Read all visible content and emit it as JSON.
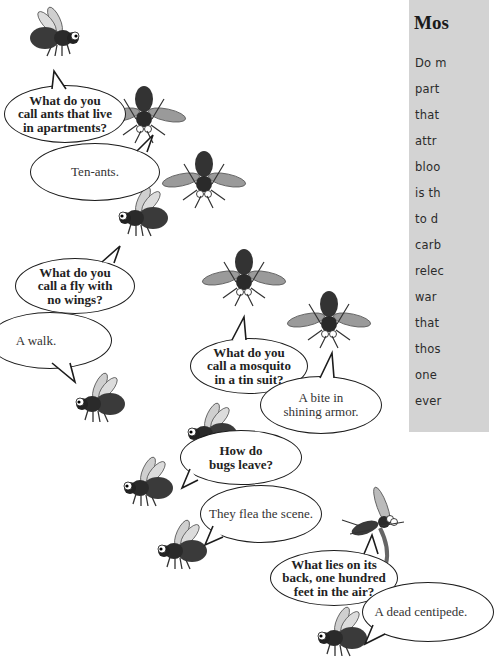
{
  "sidebar": {
    "title": "Mos",
    "lines": [
      "Do m",
      "part",
      "that",
      "attr",
      "bloo",
      "is th",
      "to d",
      "carb",
      "relec",
      "war",
      "that",
      "thos",
      "one",
      "ever"
    ],
    "background": "#d3d3d3"
  },
  "jokes": [
    {
      "question": "What do you\ncall ants that live\nin apartments?",
      "answer": "Ten-ants."
    },
    {
      "question": "What do you\ncall a fly with\nno wings?",
      "answer": "A walk."
    },
    {
      "question": "What do you\ncall a mosquito\nin a tin suit?",
      "answer": "A bite in\nshining armor."
    },
    {
      "question": "How do\nbugs leave?",
      "answer": "They flea the scene."
    },
    {
      "question": "What lies on its\nback, one hundred\nfeet in the air?",
      "answer": "A dead centipede."
    }
  ],
  "illustrations": [
    "bee-icon",
    "wasp-topdown-icon",
    "wasp-topdown-icon",
    "bee-icon",
    "wasp-topdown-icon",
    "wasp-topdown-icon",
    "bee-icon",
    "bee-icon",
    "bee-icon",
    "bee-icon",
    "wasp-side-icon",
    "bee-icon"
  ]
}
